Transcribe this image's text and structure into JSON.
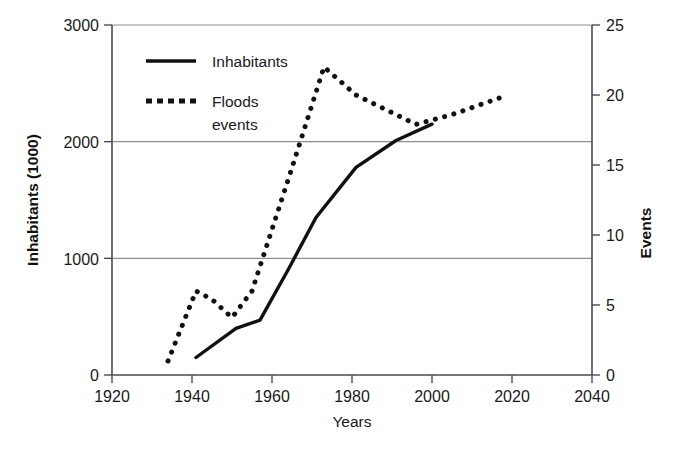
{
  "chart_data": {
    "type": "line",
    "title": "",
    "xlabel": "Years",
    "ylabel": "Inhabitants (1000)",
    "y2label": "Events",
    "xlim": [
      1920,
      2040
    ],
    "ylim": [
      0,
      3000
    ],
    "y2lim": [
      0,
      25
    ],
    "xticks": [
      "1920",
      "1940",
      "1960",
      "1980",
      "2000",
      "2020",
      "2040"
    ],
    "xtick_values": [
      1920,
      1940,
      1960,
      1980,
      2000,
      2020,
      2040
    ],
    "yticks": [
      "0",
      "1000",
      "2000",
      "3000"
    ],
    "ytick_values": [
      0,
      1000,
      2000,
      3000
    ],
    "y2ticks": [
      "0",
      "5",
      "10",
      "15",
      "20",
      "25"
    ],
    "y2tick_values": [
      0,
      5,
      10,
      15,
      20,
      25
    ],
    "grid": "horizontal-left-axis",
    "legend_position": "top-left-inside",
    "series": [
      {
        "name": "Inhabitants",
        "axis": "left",
        "style": "solid",
        "color": "#111111",
        "points": [
          {
            "x": 1941,
            "y": 150
          },
          {
            "x": 1951,
            "y": 400
          },
          {
            "x": 1957,
            "y": 470
          },
          {
            "x": 1964,
            "y": 900
          },
          {
            "x": 1971,
            "y": 1350
          },
          {
            "x": 1981,
            "y": 1780
          },
          {
            "x": 1991,
            "y": 2010
          },
          {
            "x": 2000,
            "y": 2150
          }
        ]
      },
      {
        "name": "Floods events",
        "axis": "right",
        "style": "dotted",
        "color": "#111111",
        "points": [
          {
            "x": 1934,
            "y": 1.0
          },
          {
            "x": 1941,
            "y": 6.0
          },
          {
            "x": 1945,
            "y": 5.4
          },
          {
            "x": 1950,
            "y": 4.1
          },
          {
            "x": 1955,
            "y": 6.0
          },
          {
            "x": 1965,
            "y": 14.8
          },
          {
            "x": 1973,
            "y": 22.0
          },
          {
            "x": 1981,
            "y": 20.0
          },
          {
            "x": 1996,
            "y": 17.9
          },
          {
            "x": 2005,
            "y": 18.6
          },
          {
            "x": 2012,
            "y": 19.3
          },
          {
            "x": 2019,
            "y": 20.0
          }
        ]
      }
    ]
  },
  "legend": {
    "items": [
      {
        "label": "Inhabitants",
        "style": "solid"
      },
      {
        "label": "Floods",
        "label2": "events",
        "style": "dotted"
      }
    ]
  },
  "colors": {
    "line": "#111111",
    "axis": "#4d4d4d",
    "grid": "#8c8c8c",
    "background": "#ffffff"
  }
}
